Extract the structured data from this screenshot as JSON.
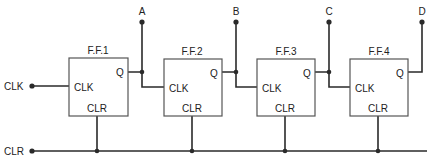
{
  "diagram": {
    "type": "4-bit ripple counter (cascaded flip-flops)",
    "inputs": {
      "clock": "CLK",
      "clear": "CLR"
    },
    "outputs": [
      "A",
      "B",
      "C",
      "D"
    ],
    "flip_flops": [
      {
        "name": "F.F.1",
        "pins": {
          "q": "Q",
          "clk": "CLK",
          "clr": "CLR"
        }
      },
      {
        "name": "F.F.2",
        "pins": {
          "q": "Q",
          "clk": "CLK",
          "clr": "CLR"
        }
      },
      {
        "name": "F.F.3",
        "pins": {
          "q": "Q",
          "clk": "CLK",
          "clr": "CLR"
        }
      },
      {
        "name": "F.F.4",
        "pins": {
          "q": "Q",
          "clk": "CLK",
          "clr": "CLR"
        }
      }
    ],
    "colors": {
      "line": "#2a2a2a",
      "box": "#555555",
      "text": "#222222",
      "background": "#ffffff"
    }
  }
}
